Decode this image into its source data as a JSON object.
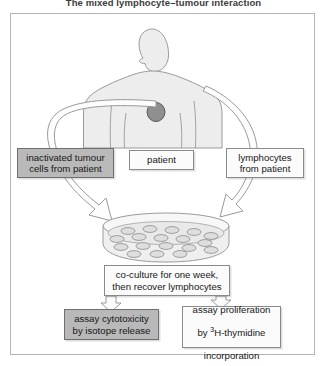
{
  "figure": {
    "caption": "The mixed lymphocyte–tumour interaction",
    "frame_border_color": "#b4b4b4",
    "background_color": "#ffffff"
  },
  "colors": {
    "shaded_box_fill": "#b9b9b9",
    "shaded_box_border": "#6f6f6f",
    "plain_box_fill": "#fbfbfb",
    "plain_box_border": "#8a8a8a",
    "body_fill": "#ededed",
    "body_outline": "#9a9a9a",
    "tumour_fill": "#8f8f8f",
    "tumour_outline": "#5a5a5a",
    "dish_fill": "#eeeeee",
    "dish_outline": "#9b9b9b",
    "cell_fill": "#dedede",
    "cell_outline": "#8c8c8c",
    "arrow_fill": "#fdfdfd",
    "arrow_outline": "#9a9a9a"
  },
  "illustrations": {
    "patient_figure": "patient-torso-silhouette",
    "tumour_marker": "tumour-site-circle",
    "culture_dish": "petri-dish",
    "dish_cell_count": 18
  },
  "boxes": {
    "inactivated_tumour": {
      "text": "inactivated tumour\ncells from patient",
      "style": "shaded"
    },
    "patient": {
      "text": "patient",
      "style": "plain"
    },
    "lymphocytes": {
      "text": "lymphocytes\nfrom patient",
      "style": "plain"
    },
    "coculture": {
      "text": "co-culture for one week,\nthen recover lymphocytes",
      "style": "plain"
    },
    "assay_cytotoxicity": {
      "text": "assay cytotoxicity\nby isotope release",
      "style": "shaded"
    },
    "assay_proliferation": {
      "line1": "assay proliferation",
      "line2_pre": "by ",
      "line2_sup": "3",
      "line2_post": "H-thymidine",
      "line3": "incorporation",
      "style": "plain"
    }
  },
  "arrows": {
    "tumour_to_dish": "curved-arrow-left",
    "lymphocytes_to_dish": "curved-arrow-right",
    "coculture_to_cytotoxicity": "block-arrow-down",
    "coculture_to_proliferation": "block-arrow-down"
  }
}
